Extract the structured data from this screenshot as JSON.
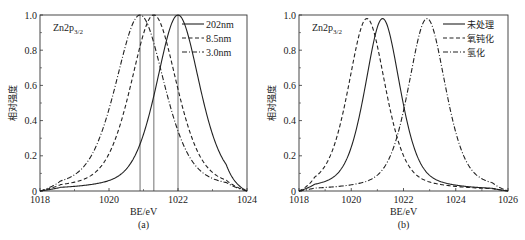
{
  "chart_data": [
    {
      "type": "line",
      "panel": "(a)",
      "xlabel": "BE/eV",
      "ylabel": "相对强度",
      "xlim": [
        1018,
        1024
      ],
      "ylim": [
        0,
        1.0
      ],
      "xticks": [
        1018,
        1020,
        1022,
        1024
      ],
      "yticks": [
        0,
        0.2,
        0.4,
        0.6,
        0.8,
        1.0
      ],
      "ytick_labels": [
        "0",
        "0.2",
        "0.4",
        "0.6",
        "0.8",
        "1.0"
      ],
      "annotation": "Zn2p3/2",
      "annotation_main": "Zn2p",
      "annotation_sub": "3/2",
      "legend_position": "upper right",
      "grid": false,
      "series": [
        {
          "name": "202nm",
          "style": "solid",
          "peak": 1022.0,
          "fwhm": 1.5,
          "height": 1.0
        },
        {
          "name": "8.5nm",
          "style": "dashed",
          "peak": 1021.3,
          "fwhm": 1.6,
          "height": 1.0
        },
        {
          "name": "3.0nm",
          "style": "dash-dot",
          "peak": 1020.9,
          "fwhm": 1.7,
          "height": 1.0
        }
      ],
      "vertical_lines": [
        1020.9,
        1021.3,
        1022.0
      ]
    },
    {
      "type": "line",
      "panel": "(b)",
      "xlabel": "BE/eV",
      "ylabel": "相对强度",
      "xlim": [
        1018,
        1026
      ],
      "ylim": [
        0,
        1.0
      ],
      "xticks": [
        1018,
        1020,
        1022,
        1024,
        1026
      ],
      "yticks": [
        0,
        0.2,
        0.4,
        0.6,
        0.8,
        1.0
      ],
      "ytick_labels": [
        "0",
        "0.2",
        "0.4",
        "0.6",
        "0.8",
        "1.0"
      ],
      "annotation": "Zn2p3/2",
      "annotation_main": "Zn2p",
      "annotation_sub": "3/2",
      "legend_position": "upper right",
      "grid": false,
      "series": [
        {
          "name": "未处理",
          "style": "solid",
          "peak": 1021.2,
          "fwhm": 1.6,
          "height": 0.98
        },
        {
          "name": "氧钝化",
          "style": "dashed",
          "peak": 1020.6,
          "fwhm": 1.7,
          "height": 0.98
        },
        {
          "name": "氢化",
          "style": "dash-dot",
          "peak": 1022.9,
          "fwhm": 1.7,
          "height": 0.98
        }
      ]
    }
  ]
}
